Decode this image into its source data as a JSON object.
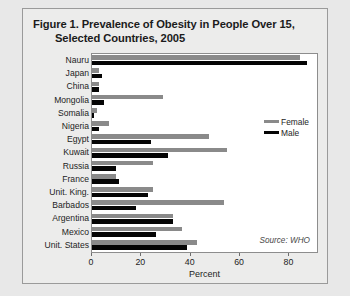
{
  "figure": {
    "title_line1": "Figure 1. Prevalence of Obesity in People Over 15,",
    "title_line2": "Selected Countries, 2005",
    "source": "Source: WHO"
  },
  "colors": {
    "female": "#8a8a8a",
    "male": "#050505",
    "panel": "#ececeb",
    "plot": "#ffffff",
    "border": "#8d8d8d"
  },
  "chart_data": {
    "type": "bar",
    "orientation": "horizontal",
    "title": "Figure 1. Prevalence of Obesity in People Over 15, Selected Countries, 2005",
    "xlabel": "Percent",
    "ylabel": "",
    "xlim": [
      0,
      92
    ],
    "xticks": [
      0,
      20,
      40,
      60,
      80
    ],
    "grid": false,
    "legend_position": "right-middle",
    "annotation": "Source: WHO",
    "categories": [
      "Nauru",
      "Japan",
      "China",
      "Mongolia",
      "Somalia",
      "Nigeria",
      "Egypt",
      "Kuwait",
      "Russia",
      "France",
      "Unit. King.",
      "Barbados",
      "Argentina",
      "Mexico",
      "Unit. States"
    ],
    "series": [
      {
        "name": "Female",
        "color": "#8a8a8a",
        "values": [
          85,
          3,
          3,
          29,
          2,
          7,
          48,
          55,
          25,
          10,
          25,
          54,
          33,
          37,
          43
        ]
      },
      {
        "name": "Male",
        "color": "#050505",
        "values": [
          88,
          4,
          3,
          5,
          1,
          3,
          24,
          31,
          10,
          11,
          23,
          18,
          33,
          26,
          39
        ]
      }
    ]
  }
}
